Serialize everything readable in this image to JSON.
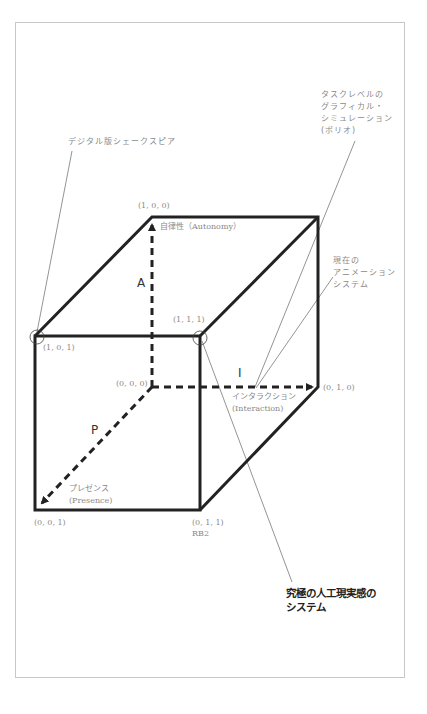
{
  "diagram": {
    "type": "3d-cube",
    "axes": {
      "A": {
        "letter": "A",
        "label": "自律性（Autonomy）"
      },
      "I": {
        "letter": "I",
        "label_jp": "インタラクション",
        "label_en": "(Interaction)"
      },
      "P": {
        "letter": "P",
        "label_jp": "プレゼンス",
        "label_en": "(Presence)"
      }
    },
    "vertices": {
      "v100": "(1, 0, 0)",
      "v101": "(1, 0, 1)",
      "v111": "(1, 1, 1)",
      "v000": "(0, 0, 0)",
      "v010": "(0, 1, 0)",
      "v001": "(0, 0, 1)",
      "v011": "(0, 1, 1)",
      "v011_name": "RB2"
    },
    "callouts": {
      "shakespeare": "デジタル版シェークスピア",
      "task_level": "タスクレベルの\nグラフィカル・\nシミュレーション\n(ポリオ)",
      "current_anim": "現在の\nアニメーション\nシステム",
      "ultimate": "究極の人工現実感の\nシステム"
    },
    "colors": {
      "line": "#222222",
      "text_gray": "#8a8a8a",
      "frame": "#c8c8c8"
    }
  }
}
